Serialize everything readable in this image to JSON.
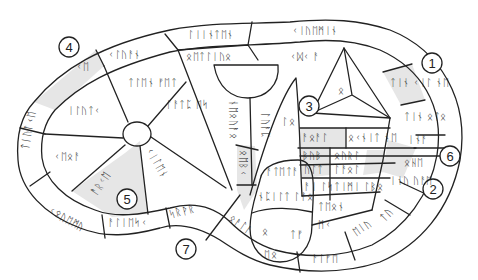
{
  "figure": {
    "callouts": [
      {
        "id": "1",
        "label": "1"
      },
      {
        "id": "2",
        "label": "2"
      },
      {
        "id": "3",
        "label": "3"
      },
      {
        "id": "4",
        "label": "4"
      },
      {
        "id": "5",
        "label": "5"
      },
      {
        "id": "6",
        "label": "6"
      },
      {
        "id": "7",
        "label": "7"
      }
    ],
    "inscriptions": {
      "top_rim_1": "ᛚᛁᛁᚾᛏᛖᚾ",
      "top_rim_2": "ᚲᛁᚢᛖᛗᛁᚾ",
      "left_rim_shaded": "ᚲᛖ",
      "left_rim_2": "ᚲᛁᚢᛏᚨ",
      "upper_left_band": "ᚲᛚᚢᚨᚾ",
      "upper_mid_band": "ᛟᛖᛏᛚᛁᚢᛟ",
      "left_rim_side": "ᛏᛁᚢᛚᚲᛖ",
      "bottom_rim_left": "ᚲᛟᚢᛖᛗᚢ",
      "bottom_rim_mid": "ᚨᛚᛁᛖᛋᚲ",
      "bottom_rim_mid2": "ᛋᚱᚹᚱ",
      "wedge_upper": "ᛏᛚᛖᚾ ᚠᛖᛏ",
      "wedge_left": "ᛁᛚᚢᛏᚲ",
      "wedge_lower_left": "ᚲᛖᛟᚨ",
      "wedge_shaded_5": "ᚨᚱᚲᛖ",
      "wedge_center_right": "ᚲᛁᛚᛖᚾ",
      "wedge_middle": "ᛚᚨᛏᛈ ᛖᛋ",
      "vertical_1": "ᚾᛖᛟᚢᚨᛟ",
      "vertical_2": "ᛚᚢᚨᛈ",
      "vertical_shaded": "ᛟᛖᛒᚲ",
      "cone_label": "ᛚᛟ",
      "pyramid_face": "ᛟ",
      "triangle_above": "ᚲᛞᚲ ᚨ",
      "right_rim_shaded_1": "ᛏᛁᚾ ᚲᛁᛚ ᚾᛖ",
      "right_rim_2": "ᛏᛁᚾ ᛟᛏᛟ",
      "right_rim_3": "ᛁᚾᚨ",
      "right_rim_4": "ᛟᚺᛖ",
      "right_rim_shaded_2": "ᛁᚾᚢ ᚢᚨᛖ",
      "right_inner_1": "ᚨᛟᚨᛚ",
      "right_inner_2": "ᛟᚲᚾᛁᛏ ᚾᛖ",
      "right_inner_3": "ᛒᚢᛒ",
      "right_inner_4": "ᛟᚢᚱᛚ",
      "right_inner_5": "ᚢᛚᛏ",
      "right_inner_6": "ᛚᚨᛟᛚ",
      "right_inner_7": "ᛏᛁᛗᛁ ᛚᛒᛟ",
      "right_inner_8": "ᚨᛁ ᛚᛋ",
      "right_inner_9": "ᛏᛖᛟᚾ",
      "right_inner_10": "ᛗᚲ",
      "lobe_upper": "ᚨᛏᛖᛏᚨ",
      "lobe_mid": "ᚾᛈᛁᛚᛏ ᛚᚨᛟ",
      "lobe_lower_left": "ᛟ",
      "lobe_lower_right": "ᛏᚠ",
      "lower_mid": "ᛟᚨᛚᚨ",
      "bottom_right_1": "ᚨᛚᚠᛖ",
      "bottom_right_2": "ᛖᛁᚢ",
      "bottom_right_3": "ᛏᚢ",
      "bottom_rim_lobe": "ᛖᛟ"
    }
  }
}
